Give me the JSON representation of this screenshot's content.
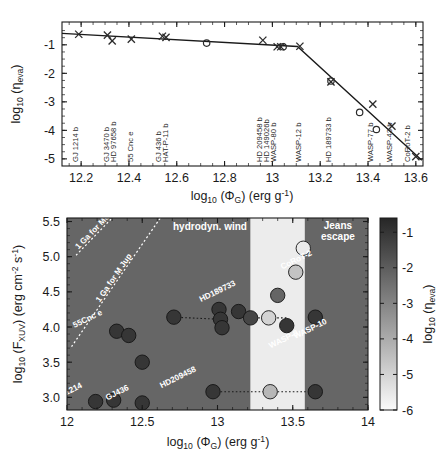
{
  "figure": {
    "title": "",
    "panels": [
      "top-eta-vs-phi",
      "bottom-fxuv-vs-phi"
    ]
  },
  "top_panel": {
    "axis": {
      "xlabel_main": "log",
      "xlabel_sub": "10",
      "xlabel_rest": " (Φ",
      "xlabel_sub2": "G",
      "xlabel_rest2": ") (erg g",
      "xlabel_sup": "-1",
      "xlabel_rest3": ")",
      "ylabel_main": "log",
      "ylabel_sub": "10",
      "ylabel_rest": " (η",
      "ylabel_sub2": "eva",
      "ylabel_rest3": ")",
      "xticks": [
        "12.2",
        "12.4",
        "12.6",
        "12.8",
        "13",
        "13.2",
        "13.4",
        "13.6"
      ],
      "xtickvals": [
        12.2,
        12.4,
        12.6,
        12.8,
        13.0,
        13.2,
        13.4,
        13.6
      ],
      "yticks": [
        "-1",
        "-2",
        "-3",
        "-4",
        "-5"
      ],
      "ytickvals": [
        -1,
        -2,
        -3,
        -4,
        -5
      ],
      "xlim": [
        12.12,
        13.63
      ],
      "ylim": [
        -5.25,
        -0.2
      ]
    },
    "planet_labels": [
      {
        "name": "GJ 1214 b",
        "x": 12.185
      },
      {
        "name": "GJ 3470 b",
        "x": 12.315
      },
      {
        "name": "HD 97658 b",
        "x": 12.345
      },
      {
        "name": "55 Cnc e",
        "x": 12.415
      },
      {
        "name": "GJ 436 b",
        "x": 12.535
      },
      {
        "name": "HAT-P-11 b",
        "x": 12.565
      },
      {
        "name": "HD 209458 b",
        "x": 12.955
      },
      {
        "name": "HD 149026b",
        "x": 12.985
      },
      {
        "name": "WASP-80 b",
        "x": 13.015
      },
      {
        "name": "WASP-12 b",
        "x": 13.12
      },
      {
        "name": "HD 189733 b",
        "x": 13.245
      },
      {
        "name": "WASP-77 b",
        "x": 13.42
      },
      {
        "name": "WASP-43 b",
        "x": 13.5
      },
      {
        "name": "CoRoT-2 b",
        "x": 13.575
      }
    ],
    "crosses": [
      {
        "x": 12.19,
        "y": -0.63
      },
      {
        "x": 12.31,
        "y": -0.66
      },
      {
        "x": 12.33,
        "y": -0.86
      },
      {
        "x": 12.41,
        "y": -0.8
      },
      {
        "x": 12.54,
        "y": -0.7
      },
      {
        "x": 12.555,
        "y": -0.74
      },
      {
        "x": 12.96,
        "y": -0.84
      },
      {
        "x": 13.02,
        "y": -1.07
      },
      {
        "x": 13.035,
        "y": -1.07
      },
      {
        "x": 13.115,
        "y": -1.05
      },
      {
        "x": 13.245,
        "y": -2.3
      },
      {
        "x": 13.42,
        "y": -3.08
      },
      {
        "x": 13.5,
        "y": -3.85
      },
      {
        "x": 13.6,
        "y": -4.92
      }
    ],
    "circles": [
      {
        "x": 12.725,
        "y": -0.94
      },
      {
        "x": 13.045,
        "y": -1.07
      },
      {
        "x": 13.245,
        "y": -2.27
      },
      {
        "x": 13.365,
        "y": -3.37
      },
      {
        "x": 13.435,
        "y": -3.97
      }
    ],
    "fit_line": [
      {
        "x": 12.12,
        "y": -0.6
      },
      {
        "x": 13.105,
        "y": -1.06
      },
      {
        "x": 13.625,
        "y": -5.05
      }
    ]
  },
  "bottom_panel": {
    "axis": {
      "xlabel_main": "log",
      "xlabel_sub": "10",
      "xlabel_rest": " (Φ",
      "xlabel_sub2": "G",
      "xlabel_rest2": ") (erg g",
      "xlabel_sup": "-1",
      "xlabel_rest3": ")",
      "ylabel_main": "log",
      "ylabel_sub": "10",
      "ylabel_rest": " (F",
      "ylabel_sub2": "XUV",
      "ylabel_rest3": ") (erg cm",
      "ylabel_sup": "-2",
      "ylabel_rest4": " s",
      "ylabel_sup2": "-1",
      "ylabel_rest5": ")",
      "xticks": [
        "12",
        "12.5",
        "13",
        "13.5",
        "14"
      ],
      "xtickvals": [
        12,
        12.5,
        13,
        13.5,
        14
      ],
      "yticks": [
        "3.0",
        "3.5",
        "4.0",
        "4.5",
        "5.0",
        "5.5"
      ],
      "ytickvals": [
        3.0,
        3.5,
        4.0,
        4.5,
        5.0,
        5.5
      ],
      "xlim": [
        12.0,
        14.0
      ],
      "ylim": [
        2.82,
        5.55
      ]
    },
    "regions": [
      {
        "label": "hydrodyn. wind",
        "x_label": 12.95,
        "y_label": 5.46
      },
      {
        "label": "Jeans escape",
        "x_label": 13.78,
        "y_label": 5.46
      }
    ],
    "region_label_lines": [
      "Jeans",
      "escape"
    ],
    "dotted_guides": [
      {
        "text": "1 Ga for Mearth",
        "display": "1 Ga for Me",
        "x1": 12.06,
        "y1": 5.02,
        "x2": 12.3,
        "y2": 5.55
      },
      {
        "text": "1 Ga for MJup",
        "display": "1 Ga for M Jup",
        "x1": 12.03,
        "y1": 3.72,
        "x2": 12.62,
        "y2": 5.55
      }
    ],
    "points": [
      {
        "name": "GJ1214",
        "x": 12.19,
        "y": 2.94,
        "eta": -1.0,
        "label_dx": -26,
        "label_dy": -8
      },
      {
        "name": "",
        "x": 12.31,
        "y": 2.96,
        "eta": -1.0
      },
      {
        "name": "GJ436",
        "x": 12.5,
        "y": 2.92,
        "eta": -1.0,
        "label_dx": -24,
        "label_dy": -8
      },
      {
        "name": "55Cnc e",
        "x": 12.33,
        "y": 3.94,
        "eta": -1.0,
        "label_dx": -28,
        "label_dy": -10
      },
      {
        "name": "",
        "x": 12.41,
        "y": 3.88,
        "eta": -1.0
      },
      {
        "name": "",
        "x": 12.5,
        "y": 3.5,
        "eta": -1.0
      },
      {
        "name": "HD209458",
        "x": 12.97,
        "y": 3.08,
        "eta": -1.0,
        "label_dx": -34,
        "label_dy": -12
      },
      {
        "name": "",
        "x": 13.35,
        "y": 3.08,
        "eta": -4.3
      },
      {
        "name": "",
        "x": 13.65,
        "y": 3.08,
        "eta": -1.0
      },
      {
        "name": "",
        "x": 12.71,
        "y": 4.14,
        "eta": -1.0
      },
      {
        "name": "",
        "x": 13.01,
        "y": 4.25,
        "eta": -1.0
      },
      {
        "name": "",
        "x": 13.02,
        "y": 4.11,
        "eta": -1.0
      },
      {
        "name": "",
        "x": 13.03,
        "y": 3.99,
        "eta": -1.0
      },
      {
        "name": "HD189733",
        "x": 13.14,
        "y": 4.22,
        "eta": -1.0,
        "label_dx": -20,
        "label_dy": -18
      },
      {
        "name": "",
        "x": 13.22,
        "y": 4.13,
        "eta": -1.4
      },
      {
        "name": "",
        "x": 13.34,
        "y": 4.13,
        "eta": -5.0
      },
      {
        "name": "",
        "x": 13.4,
        "y": 4.45,
        "eta": -2.2
      },
      {
        "name": "",
        "x": 13.52,
        "y": 4.78,
        "eta": -4.6
      },
      {
        "name": "CoRoT-2",
        "x": 13.57,
        "y": 5.12,
        "eta": -5.6,
        "label_dx": -6,
        "label_dy": 14
      },
      {
        "name": "WASP-8",
        "x": 13.46,
        "y": 4.02,
        "eta": -1.0,
        "label_dx": -2,
        "label_dy": 16
      },
      {
        "name": "WASP-10",
        "x": 13.65,
        "y": 4.14,
        "eta": -1.0,
        "label_dx": -4,
        "label_dy": 14
      }
    ],
    "connectors": [
      {
        "x1": 12.97,
        "y1": 3.08,
        "x2": 13.65,
        "y2": 3.08
      },
      {
        "x1": 12.71,
        "y1": 4.14,
        "x2": 13.02,
        "y2": 4.11
      },
      {
        "x1": 13.22,
        "y1": 4.13,
        "x2": 13.46,
        "y2": 4.13
      }
    ],
    "colorbar": {
      "label_main": "log",
      "label_sub": "10",
      "label_rest": " (η",
      "label_sub2": "eva",
      "label_rest3": ")",
      "ticks": [
        "-1",
        "-2",
        "-3",
        "-4",
        "-5",
        "-6"
      ],
      "tickvals": [
        -1,
        -2,
        -3,
        -4,
        -5,
        -6
      ],
      "vmin": -6,
      "vmax": -0.6
    }
  },
  "colors": {
    "background": "#ffffff",
    "axis": "#1a1a1a",
    "marker_dark": "#3a3a3a",
    "plot_dark_band": "#666666",
    "plot_light_band": "#ececec",
    "region_white_text": "#ffffff",
    "fit_line": "#1a1a1a"
  }
}
